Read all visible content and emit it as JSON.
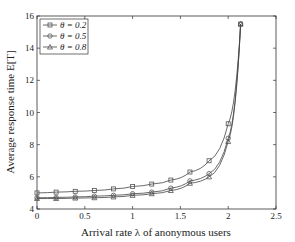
{
  "chart_data": {
    "type": "line",
    "title": "",
    "xlabel": "Arrival rate λ of anonymous users",
    "ylabel": "Average response time E[T]",
    "xlim": [
      0,
      2.5
    ],
    "ylim": [
      4,
      16
    ],
    "xticks": [
      "0",
      "0.5",
      "1",
      "1.5",
      "2",
      "2.5"
    ],
    "yticks": [
      "4",
      "6",
      "8",
      "10",
      "12",
      "14",
      "16"
    ],
    "grid": false,
    "legend_position": "upper left",
    "x": [
      0,
      0.2,
      0.4,
      0.6,
      0.8,
      1.0,
      1.2,
      1.4,
      1.6,
      1.8,
      2.0,
      2.13
    ],
    "series": [
      {
        "name": "θ = 0.2",
        "marker": "square",
        "values": [
          5.0,
          5.05,
          5.1,
          5.15,
          5.25,
          5.4,
          5.55,
          5.8,
          6.3,
          7.0,
          9.3,
          15.5
        ]
      },
      {
        "name": "θ = 0.5",
        "marker": "circle",
        "values": [
          4.7,
          4.72,
          4.75,
          4.8,
          4.85,
          4.95,
          5.05,
          5.3,
          5.75,
          6.2,
          8.4,
          15.5
        ]
      },
      {
        "name": "θ = 0.8",
        "marker": "triangle",
        "values": [
          4.65,
          4.65,
          4.68,
          4.7,
          4.75,
          4.85,
          4.95,
          5.15,
          5.6,
          6.0,
          8.2,
          15.5
        ]
      }
    ]
  }
}
